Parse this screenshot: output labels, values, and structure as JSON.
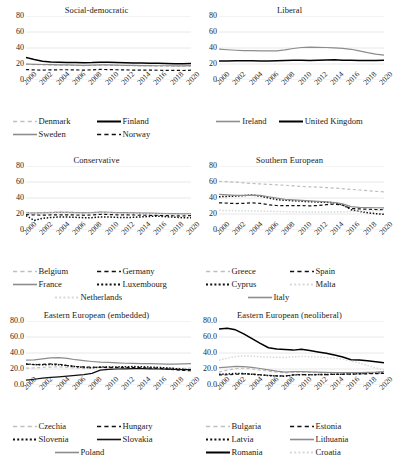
{
  "figure": {
    "panel_count": 6,
    "x_tick_labels": [
      "2000",
      "2002",
      "2004",
      "2006",
      "2008",
      "2010",
      "2012",
      "2014",
      "2016",
      "2018",
      "2020"
    ]
  },
  "colors": {
    "black": "#000000",
    "dark": "#222222",
    "mid_gray": "#8c8c8c",
    "light_gray": "#bfbfbf",
    "very_light_gray": "#d9d9d9",
    "gridline": "#d9d9d9"
  },
  "chart_data": [
    {
      "type": "line",
      "title": "Social-democratic",
      "xlabel": "",
      "ylabel": "",
      "ylim": [
        0,
        80
      ],
      "yticks": [
        "0",
        "20",
        "40",
        "60",
        "80"
      ],
      "grid": true,
      "legend_position": "bottom",
      "x": [
        2000,
        2001,
        2002,
        2003,
        2004,
        2005,
        2006,
        2007,
        2008,
        2009,
        2010,
        2011,
        2012,
        2013,
        2014,
        2015,
        2016,
        2017,
        2018,
        2019,
        2020
      ],
      "series": [
        {
          "name": "Denmark",
          "style": "dashed",
          "color": "#bfbfbf",
          "values": [
            19.6,
            19.2,
            19.0,
            18.8,
            18.6,
            18.4,
            18.2,
            18.0,
            18.2,
            18.6,
            18.4,
            18.2,
            18.0,
            17.8,
            17.6,
            17.5,
            17.4,
            17.3,
            17.2,
            17.2,
            17.4
          ]
        },
        {
          "name": "Finland",
          "style": "solid",
          "color": "#000000",
          "values": [
            28.0,
            25.5,
            23.5,
            22.6,
            22.2,
            22.0,
            21.8,
            21.6,
            21.8,
            22.3,
            22.2,
            21.9,
            21.6,
            21.4,
            21.2,
            21.0,
            20.8,
            20.6,
            20.4,
            20.3,
            20.7
          ]
        },
        {
          "name": "Sweden",
          "style": "solid",
          "color": "#8c8c8c",
          "values": [
            20.0,
            19.6,
            19.4,
            19.2,
            19.0,
            18.8,
            18.6,
            18.4,
            18.6,
            19.0,
            18.8,
            18.6,
            18.4,
            18.2,
            18.0,
            17.9,
            17.8,
            17.8,
            17.7,
            17.6,
            18.0
          ]
        },
        {
          "name": "Norway",
          "style": "dashed",
          "color": "#111111",
          "values": [
            13.0,
            12.6,
            12.4,
            12.6,
            12.8,
            12.8,
            12.6,
            12.4,
            12.6,
            13.2,
            13.0,
            12.8,
            12.6,
            12.4,
            12.4,
            12.3,
            12.2,
            12.1,
            12.0,
            11.9,
            12.3
          ]
        }
      ]
    },
    {
      "type": "line",
      "title": "Liberal",
      "xlabel": "",
      "ylabel": "",
      "ylim": [
        0,
        80
      ],
      "yticks": [
        "0",
        "20",
        "40",
        "60",
        "80"
      ],
      "grid": true,
      "legend_position": "bottom",
      "x": [
        2000,
        2001,
        2002,
        2003,
        2004,
        2005,
        2006,
        2007,
        2008,
        2009,
        2010,
        2011,
        2012,
        2013,
        2014,
        2015,
        2016,
        2017,
        2018,
        2019,
        2020
      ],
      "series": [
        {
          "name": "Ireland",
          "style": "solid",
          "color": "#8c8c8c",
          "values": [
            38.5,
            37.8,
            37.2,
            36.8,
            36.6,
            36.4,
            36.3,
            36.5,
            37.6,
            39.4,
            40.6,
            41.0,
            40.9,
            40.6,
            40.2,
            39.6,
            38.4,
            36.4,
            34.2,
            32.4,
            31.2
          ]
        },
        {
          "name": "United Kingdom",
          "style": "solid",
          "color": "#000000",
          "values": [
            23.6,
            23.8,
            24.0,
            24.2,
            24.0,
            23.8,
            23.8,
            24.0,
            24.4,
            24.8,
            24.6,
            24.4,
            24.6,
            25.0,
            25.2,
            24.8,
            24.6,
            24.4,
            24.4,
            24.4,
            24.8
          ]
        }
      ]
    },
    {
      "type": "line",
      "title": "Conservative",
      "xlabel": "",
      "ylabel": "",
      "ylim": [
        0,
        80
      ],
      "yticks": [
        "0",
        "20",
        "40",
        "60",
        "80"
      ],
      "grid": true,
      "legend_position": "bottom",
      "x": [
        2000,
        2001,
        2002,
        2003,
        2004,
        2005,
        2006,
        2007,
        2008,
        2009,
        2010,
        2011,
        2012,
        2013,
        2014,
        2015,
        2016,
        2017,
        2018,
        2019,
        2020
      ],
      "series": [
        {
          "name": "Belgium",
          "style": "dashed",
          "color": "#bfbfbf",
          "values": [
            22.0,
            21.6,
            21.8,
            22.2,
            22.6,
            22.4,
            22.0,
            21.6,
            21.8,
            22.4,
            22.2,
            21.8,
            21.4,
            21.2,
            21.0,
            20.8,
            20.6,
            20.4,
            20.2,
            20.0,
            20.2
          ]
        },
        {
          "name": "Germany",
          "style": "dashed",
          "color": "#111111",
          "values": [
            19.2,
            18.8,
            18.6,
            18.8,
            19.0,
            19.0,
            18.8,
            18.6,
            18.8,
            19.6,
            19.4,
            19.0,
            18.8,
            18.8,
            18.6,
            18.4,
            18.2,
            18.0,
            17.8,
            17.6,
            18.0
          ]
        },
        {
          "name": "France",
          "style": "solid",
          "color": "#8c8c8c",
          "values": [
            21.4,
            21.2,
            21.4,
            21.8,
            22.2,
            22.0,
            21.6,
            21.4,
            21.6,
            22.4,
            22.2,
            21.8,
            21.6,
            21.4,
            21.2,
            21.0,
            20.8,
            20.6,
            20.4,
            20.2,
            20.6
          ]
        },
        {
          "name": "Luxembourg",
          "style": "dotted",
          "color": "#111111",
          "values": [
            18.0,
            12.0,
            14.6,
            15.6,
            16.2,
            16.2,
            15.8,
            15.4,
            15.4,
            16.4,
            16.2,
            15.8,
            15.6,
            15.8,
            16.4,
            17.0,
            17.2,
            16.6,
            16.0,
            15.4,
            15.2
          ]
        },
        {
          "name": "Netherlands",
          "style": "dotted",
          "color": "#d9d9d9",
          "values": [
            21.0,
            20.6,
            20.8,
            21.2,
            21.4,
            21.2,
            20.8,
            20.4,
            20.6,
            21.4,
            21.2,
            20.8,
            20.6,
            20.4,
            20.2,
            20.0,
            19.8,
            19.6,
            19.4,
            19.2,
            19.6
          ]
        }
      ]
    },
    {
      "type": "line",
      "title": "Southern European",
      "xlabel": "",
      "ylabel": "",
      "ylim": [
        0,
        80
      ],
      "yticks": [
        "0",
        "20",
        "40",
        "60",
        "80"
      ],
      "grid": true,
      "legend_position": "bottom",
      "x": [
        2000,
        2001,
        2002,
        2003,
        2004,
        2005,
        2006,
        2007,
        2008,
        2009,
        2010,
        2011,
        2012,
        2013,
        2014,
        2015,
        2016,
        2017,
        2018,
        2019,
        2020
      ],
      "series": [
        {
          "name": "Greece",
          "style": "dashed",
          "color": "#bfbfbf",
          "values": [
            60.8,
            60.4,
            59.8,
            59.0,
            58.2,
            57.6,
            57.0,
            56.4,
            56.0,
            55.2,
            54.4,
            54.0,
            53.6,
            53.0,
            52.4,
            51.6,
            50.8,
            50.0,
            49.2,
            48.4,
            47.6
          ]
        },
        {
          "name": "Spain",
          "style": "dashed",
          "color": "#111111",
          "values": [
            34.0,
            33.6,
            33.0,
            33.4,
            34.0,
            33.2,
            31.6,
            30.6,
            30.4,
            30.6,
            30.4,
            30.2,
            30.6,
            31.6,
            32.4,
            31.0,
            26.8,
            26.4,
            26.0,
            25.6,
            25.4
          ]
        },
        {
          "name": "Cyprus",
          "style": "dotted",
          "color": "#111111",
          "values": [
            41.6,
            42.0,
            42.4,
            43.0,
            43.6,
            42.4,
            40.0,
            38.0,
            37.2,
            36.6,
            36.0,
            35.4,
            35.0,
            34.6,
            34.0,
            31.4,
            25.4,
            23.2,
            21.6,
            20.4,
            19.6
          ]
        },
        {
          "name": "Malta",
          "style": "dotted",
          "color": "#d9d9d9",
          "values": [
            24.6,
            24.4,
            24.2,
            24.0,
            23.8,
            23.6,
            23.4,
            23.2,
            23.0,
            22.8,
            22.6,
            22.6,
            22.6,
            22.6,
            22.6,
            22.8,
            23.0,
            23.4,
            23.8,
            24.2,
            24.6
          ]
        },
        {
          "name": "Italy",
          "style": "solid",
          "color": "#8c8c8c",
          "values": [
            44.6,
            44.0,
            43.4,
            43.2,
            43.6,
            43.2,
            41.6,
            39.8,
            38.4,
            37.6,
            37.0,
            36.4,
            35.8,
            35.2,
            34.4,
            32.6,
            29.2,
            28.4,
            28.0,
            27.8,
            27.6
          ]
        }
      ]
    },
    {
      "type": "line",
      "title": "Eastern European (embedded)",
      "xlabel": "",
      "ylabel": "",
      "ylim": [
        0,
        80
      ],
      "yticks": [
        "0.0",
        "20.0",
        "40.0",
        "60.0",
        "80.0"
      ],
      "grid": true,
      "legend_position": "bottom",
      "x": [
        2000,
        2001,
        2002,
        2003,
        2004,
        2005,
        2006,
        2007,
        2008,
        2009,
        2010,
        2011,
        2012,
        2013,
        2014,
        2015,
        2016,
        2017,
        2018,
        2019,
        2020
      ],
      "series": [
        {
          "name": "Czechia",
          "style": "dashed",
          "color": "#bfbfbf",
          "values": [
            21.0,
            21.4,
            22.0,
            22.4,
            22.6,
            22.0,
            21.4,
            21.0,
            21.2,
            22.6,
            22.8,
            22.6,
            22.4,
            22.2,
            22.0,
            21.6,
            21.4,
            21.2,
            21.0,
            20.8,
            21.0
          ]
        },
        {
          "name": "Hungary",
          "style": "dashed",
          "color": "#111111",
          "values": [
            26.0,
            25.4,
            25.8,
            26.4,
            26.0,
            24.4,
            23.2,
            22.6,
            22.4,
            22.0,
            21.8,
            21.6,
            21.6,
            21.8,
            21.6,
            21.2,
            20.8,
            20.2,
            19.2,
            18.4,
            17.8
          ]
        },
        {
          "name": "Slovenia",
          "style": "dotted",
          "color": "#111111",
          "values": [
            26.4,
            25.6,
            25.2,
            25.6,
            25.2,
            24.2,
            23.0,
            22.0,
            21.6,
            22.4,
            22.6,
            22.6,
            22.8,
            23.0,
            22.8,
            22.4,
            22.0,
            21.4,
            20.6,
            19.6,
            19.0
          ]
        },
        {
          "name": "Slovakia",
          "style": "solid",
          "color": "#111111",
          "values": [
            6.0,
            7.2,
            8.6,
            9.6,
            10.2,
            11.0,
            12.0,
            13.0,
            14.6,
            18.6,
            19.6,
            20.0,
            20.2,
            20.4,
            20.4,
            20.2,
            20.0,
            19.8,
            19.6,
            19.2,
            19.4
          ]
        },
        {
          "name": "Poland",
          "style": "solid",
          "color": "#8c8c8c",
          "values": [
            31.0,
            31.4,
            32.6,
            33.8,
            34.2,
            33.2,
            31.6,
            30.4,
            29.4,
            28.6,
            28.2,
            27.6,
            27.2,
            27.0,
            26.8,
            26.6,
            26.4,
            26.2,
            26.2,
            26.4,
            26.8
          ]
        }
      ]
    },
    {
      "type": "line",
      "title": "Eastern European (neoliberal)",
      "xlabel": "",
      "ylabel": "",
      "ylim": [
        0,
        80
      ],
      "yticks": [
        "0.0",
        "20.0",
        "40.0",
        "60.0",
        "80.0"
      ],
      "grid": true,
      "legend_position": "bottom",
      "x": [
        2000,
        2001,
        2002,
        2003,
        2004,
        2005,
        2006,
        2007,
        2008,
        2009,
        2010,
        2011,
        2012,
        2013,
        2014,
        2015,
        2016,
        2017,
        2018,
        2019,
        2020
      ],
      "series": [
        {
          "name": "Bulgaria",
          "style": "dashed",
          "color": "#bfbfbf",
          "values": [
            16.0,
            18.6,
            20.4,
            21.0,
            20.0,
            18.6,
            17.2,
            16.0,
            15.2,
            15.8,
            16.0,
            15.6,
            15.2,
            15.0,
            14.8,
            14.4,
            14.0,
            14.2,
            14.4,
            14.6,
            15.0
          ]
        },
        {
          "name": "Estonia",
          "style": "dashed",
          "color": "#111111",
          "values": [
            12.6,
            12.8,
            13.4,
            14.0,
            13.6,
            12.8,
            12.0,
            11.4,
            11.2,
            12.6,
            13.0,
            12.8,
            12.8,
            13.0,
            13.2,
            13.4,
            13.6,
            13.8,
            14.0,
            14.2,
            14.6
          ]
        },
        {
          "name": "Latvia",
          "style": "dotted",
          "color": "#111111",
          "values": [
            13.4,
            13.8,
            14.4,
            14.2,
            13.4,
            12.6,
            11.8,
            11.2,
            11.0,
            12.4,
            13.0,
            12.8,
            13.0,
            13.2,
            13.4,
            13.6,
            13.8,
            14.2,
            14.6,
            15.0,
            15.4
          ]
        },
        {
          "name": "Lithuania",
          "style": "solid",
          "color": "#8c8c8c",
          "values": [
            21.6,
            22.4,
            23.2,
            23.0,
            22.0,
            20.6,
            19.0,
            17.4,
            16.2,
            16.6,
            16.8,
            16.4,
            16.0,
            15.8,
            15.6,
            15.4,
            15.4,
            15.6,
            15.8,
            16.0,
            16.6
          ]
        },
        {
          "name": "Romania",
          "style": "solid",
          "color": "#000000",
          "values": [
            70.0,
            71.0,
            69.0,
            64.0,
            58.0,
            52.0,
            46.6,
            45.0,
            44.4,
            43.6,
            44.8,
            43.0,
            41.2,
            39.6,
            37.6,
            35.0,
            31.6,
            31.4,
            30.4,
            29.2,
            27.8
          ]
        },
        {
          "name": "Croatia",
          "style": "dotted",
          "color": "#d9d9d9",
          "values": [
            31.0,
            33.6,
            35.6,
            36.4,
            36.0,
            35.4,
            35.0,
            34.6,
            34.4,
            35.2,
            35.6,
            35.4,
            35.0,
            34.4,
            33.6,
            32.2,
            30.0,
            27.4,
            24.4,
            21.4,
            19.0
          ]
        }
      ]
    }
  ]
}
